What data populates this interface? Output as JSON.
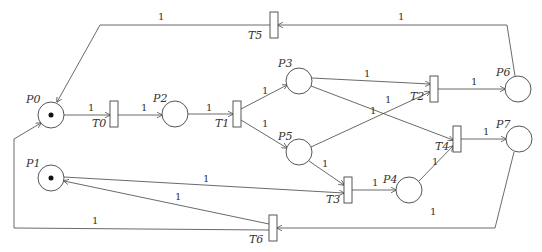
{
  "diagram": {
    "type": "petri-net",
    "places": [
      {
        "id": "P0",
        "label": "P0",
        "cx": 51,
        "cy": 115,
        "tokens": 1,
        "lx": 26,
        "ly": 103
      },
      {
        "id": "P1",
        "label": "P1",
        "cx": 51,
        "cy": 178,
        "tokens": 1,
        "lx": 26,
        "ly": 167
      },
      {
        "id": "P2",
        "label": "P2",
        "cx": 175,
        "cy": 114,
        "tokens": 0,
        "lx": 153,
        "ly": 102
      },
      {
        "id": "P3",
        "label": "P3",
        "cx": 299,
        "cy": 81,
        "tokens": 0,
        "lx": 278,
        "ly": 67
      },
      {
        "id": "P4",
        "label": "P4",
        "cx": 409,
        "cy": 190,
        "tokens": 0,
        "lx": 383,
        "ly": 183
      },
      {
        "id": "P5",
        "label": "P5",
        "cx": 299,
        "cy": 152,
        "tokens": 0,
        "lx": 278,
        "ly": 140
      },
      {
        "id": "P6",
        "label": "P6",
        "cx": 518,
        "cy": 89,
        "tokens": 0,
        "lx": 496,
        "ly": 76
      },
      {
        "id": "P7",
        "label": "P7",
        "cx": 519,
        "cy": 139,
        "tokens": 0,
        "lx": 496,
        "ly": 128
      }
    ],
    "transitions": [
      {
        "id": "T0",
        "label": "T0",
        "x": 110,
        "y": 101,
        "lx": 92,
        "ly": 127
      },
      {
        "id": "T1",
        "label": "T1",
        "x": 233,
        "y": 101,
        "lx": 215,
        "ly": 127
      },
      {
        "id": "T2",
        "label": "T2",
        "x": 430,
        "y": 76,
        "lx": 410,
        "ly": 100
      },
      {
        "id": "T3",
        "label": "T3",
        "x": 344,
        "y": 177,
        "lx": 326,
        "ly": 203
      },
      {
        "id": "T4",
        "label": "T4",
        "x": 453,
        "y": 126,
        "lx": 435,
        "ly": 150
      },
      {
        "id": "T5",
        "label": "T5",
        "x": 270,
        "y": 12,
        "lx": 248,
        "ly": 39
      },
      {
        "id": "T6",
        "label": "T6",
        "x": 269,
        "y": 215,
        "lx": 249,
        "ly": 243
      }
    ],
    "arcs": [
      {
        "from": "P0",
        "to": "T0",
        "weight": "1",
        "d": "M64,115 L110,115",
        "wx": 88,
        "wy": 111
      },
      {
        "from": "T0",
        "to": "P2",
        "weight": "1",
        "d": "M117,115 L162,115",
        "wx": 141,
        "wy": 111
      },
      {
        "from": "P2",
        "to": "T1",
        "weight": "1",
        "d": "M188,114 L233,114",
        "wx": 206,
        "wy": 111
      },
      {
        "from": "T1",
        "to": "P3",
        "weight": "1",
        "d": "M241,109 L287,85",
        "wx": 262,
        "wy": 94
      },
      {
        "from": "T1",
        "to": "P5",
        "weight": "1",
        "d": "M241,120 L287,148",
        "wx": 262,
        "wy": 127
      },
      {
        "from": "P3",
        "to": "T2",
        "weight": "1",
        "d": "M312,78 L430,84",
        "wx": 364,
        "wy": 77
      },
      {
        "from": "P3",
        "to": "T4",
        "weight": "1",
        "d": "M311,86 L453,140",
        "wx": 385,
        "wy": 103
      },
      {
        "from": "P5",
        "to": "T2",
        "weight": "1",
        "d": "M311,147 L430,92",
        "wx": 370,
        "wy": 114
      },
      {
        "from": "T2",
        "to": "P6",
        "weight": "1",
        "d": "M438,89 L505,89",
        "wx": 471,
        "wy": 85
      },
      {
        "from": "P5",
        "to": "T3",
        "weight": "1",
        "d": "M309,161 L344,185",
        "wx": 322,
        "wy": 167
      },
      {
        "from": "P1",
        "to": "T3",
        "weight": "1",
        "d": "M64,177 L344,193",
        "wx": 203,
        "wy": 182
      },
      {
        "from": "T3",
        "to": "P4",
        "weight": "1",
        "d": "M352,190 L396,190",
        "wx": 372,
        "wy": 186
      },
      {
        "from": "P4",
        "to": "T4",
        "weight": "1",
        "d": "M419,181 L453,146",
        "wx": 432,
        "wy": 165
      },
      {
        "from": "T4",
        "to": "P7",
        "weight": "1",
        "d": "M461,139 L506,139",
        "wx": 483,
        "wy": 135
      },
      {
        "from": "P6",
        "to": "T5",
        "weight": "1",
        "d": "M515,76 L507,25 L278,25",
        "wx": 398,
        "wy": 20
      },
      {
        "from": "T5",
        "to": "P0",
        "weight": "1",
        "d": "M270,25 L100,25 L57,102",
        "wx": 158,
        "wy": 20
      },
      {
        "from": "P7",
        "to": "T6",
        "weight": "1",
        "d": "M514,152 L495,228 L277,228",
        "wx": 430,
        "wy": 215
      },
      {
        "from": "T6",
        "to": "P1",
        "weight": "1",
        "d": "M269,224 L64,181",
        "wx": 175,
        "wy": 200
      },
      {
        "from": "T6",
        "to": "P0",
        "weight": "1",
        "d": "M269,230 L14,228 L14,139 L41,123",
        "wx": 92,
        "wy": 224
      }
    ]
  }
}
